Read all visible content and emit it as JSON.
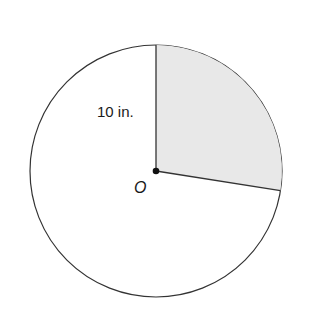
{
  "diagram": {
    "type": "circle-sector",
    "center_label": "O",
    "radius_label": "10 in.",
    "radius_value_in": 10,
    "sector": {
      "start_angle_deg_from_top_clockwise": 0,
      "end_angle_deg_from_top_clockwise": 99,
      "shaded": true,
      "fill_color": "#e8e8e8"
    },
    "line_color": "#333333"
  }
}
